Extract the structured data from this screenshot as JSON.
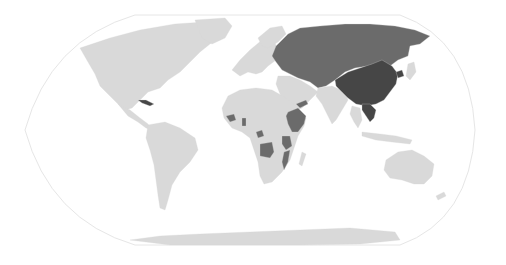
{
  "map": {
    "projection": "Robinson",
    "colors": {
      "background": "#ffffff",
      "frame": "#e6e6e6",
      "other": "#d9d9d9",
      "medium": "#6b6b6b",
      "dark": "#464646"
    },
    "highlight_groups": [
      {
        "shade": "dark",
        "regions": [
          "China",
          "North Korea",
          "Vietnam",
          "Laos",
          "Cuba"
        ]
      },
      {
        "shade": "medium",
        "regions": [
          "Russia",
          "Eastern Europe",
          "Central Asia",
          "Mongolia",
          "Afghanistan",
          "Ethiopia",
          "Somalia",
          "Yemen",
          "Angola",
          "Mozambique",
          "Tanzania",
          "Guinea",
          "Benin",
          "Congo"
        ]
      }
    ]
  }
}
